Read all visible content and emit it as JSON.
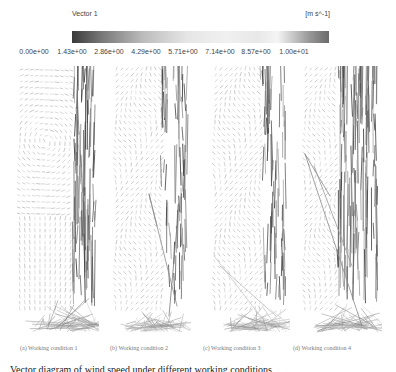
{
  "legend": {
    "title": "Vector 1",
    "unit": "[m s^-1]",
    "ticks": [
      "0.00e+00",
      "1.43e+00",
      "2.86e+00",
      "4.29e+00",
      "5.71e+00",
      "7.14e+00",
      "8.57e+00",
      "1.00e+01"
    ]
  },
  "panels": [
    {
      "id": "a",
      "caption": "(a)  Working condition 1"
    },
    {
      "id": "b",
      "caption": "(b)  Working condition 2"
    },
    {
      "id": "c",
      "caption": "(c)  Working condition 3"
    },
    {
      "id": "d",
      "caption": "(d)  Working condition 4"
    }
  ],
  "figure_caption": "Vector diagram of wind speed under different working conditions",
  "chart_data": {
    "type": "vector-field",
    "title": "Vector 1",
    "colorbar": {
      "label": "Vector 1",
      "unit": "m s^-1",
      "range": [
        0,
        10
      ],
      "ticks": [
        0.0,
        1.43,
        2.86,
        4.29,
        5.71,
        7.14,
        8.57,
        10.0
      ],
      "tick_labels": [
        "0.00e+00",
        "1.43e+00",
        "2.86e+00",
        "4.29e+00",
        "5.71e+00",
        "7.14e+00",
        "8.57e+00",
        "1.00e+01"
      ]
    },
    "subplots": [
      {
        "label": "(a) Working condition 1",
        "features": "large clockwise recirculation vortex on left; strong upward jet along right wall; inflow fan at bottom"
      },
      {
        "label": "(b) Working condition 2",
        "features": "weak recirculation; strong jet concentrated along right wall; long diagonal vectors in lower middle"
      },
      {
        "label": "(c) Working condition 3",
        "features": "weak recirculation; jet along right wall; diagonal streaks from lower-left"
      },
      {
        "label": "(d) Working condition 4",
        "features": "broad high-speed upward jet in right half; long diagonal vectors from left; inflow fan at bottom"
      }
    ],
    "xlabel": "",
    "ylabel": ""
  }
}
